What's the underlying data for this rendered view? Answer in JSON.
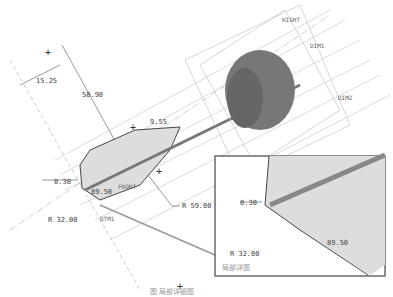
{
  "drawing": {
    "dimensions": {
      "d1": "15.25",
      "d2": "50.90",
      "d3": "9.55",
      "d4": "0.30",
      "d5": "89.50",
      "d6": "R 32.00",
      "d7": "R 59.00"
    },
    "datums": {
      "right": "RIGHT",
      "top": "TOP",
      "dim1": "DIM1",
      "dim2": "DIM2",
      "front": "FRONT",
      "dtm1": "DTM1"
    },
    "detail_view": {
      "dim_gap": "0.30",
      "dim_angle": "89.50",
      "dim_radius": "R 32.00",
      "label": "局部详图"
    }
  },
  "caption": "图      局部详细图"
}
